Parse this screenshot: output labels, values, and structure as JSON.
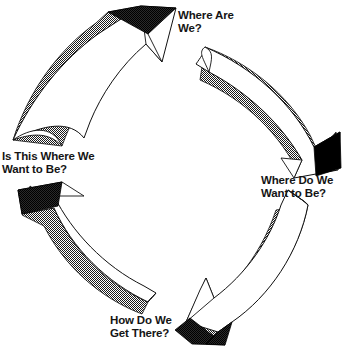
{
  "diagram": {
    "kind": "cycle-diagram",
    "type": "four-stage-clockwise-cycle",
    "direction": "clockwise",
    "background_color": "#ffffff",
    "arrow_fill_color": "#ffffff",
    "arrow_outline_color": "#000000",
    "arrow_shade_color": "#2b2b2b",
    "arrow_shade_pattern": "halftone-dither",
    "text_color": "#151515",
    "arrow_count": 4,
    "stages": [
      {
        "id": "stage-1",
        "position": "top",
        "label": "Where Are\nWe?",
        "label_line_1": "Where Are",
        "label_line_2": "We?"
      },
      {
        "id": "stage-2",
        "position": "right",
        "label": "Where Do We\nWant to Be?",
        "label_line_1": "Where Do We",
        "label_line_2": "Want to Be?"
      },
      {
        "id": "stage-3",
        "position": "bottom",
        "label": "How Do We\nGet There?",
        "label_line_1": "How Do We",
        "label_line_2": "Get There?"
      },
      {
        "id": "stage-4",
        "position": "left",
        "label": "Is This Where We\nWant to Be?",
        "label_line_1": "Is This Where We",
        "label_line_2": "Want to Be?"
      }
    ],
    "arrows": [
      {
        "id": "arrow-top-left",
        "name": "arrow-pointing-to-where-are-we",
        "from": "left",
        "to": "top"
      },
      {
        "id": "arrow-top-right",
        "name": "arrow-pointing-to-where-do-we-want-to-be",
        "from": "top",
        "to": "right"
      },
      {
        "id": "arrow-bottom-right",
        "name": "arrow-pointing-to-how-do-we-get-there",
        "from": "right",
        "to": "bottom"
      },
      {
        "id": "arrow-bottom-left",
        "name": "arrow-pointing-to-is-this-where-we-want-to-be",
        "from": "bottom",
        "to": "left"
      }
    ]
  }
}
